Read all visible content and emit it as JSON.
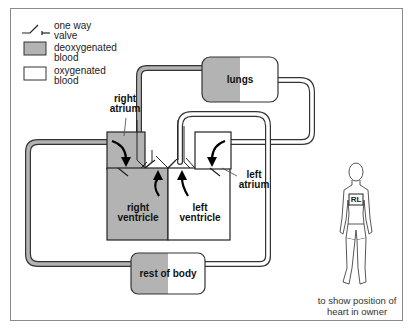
{
  "legend": {
    "items": [
      {
        "icon": "one-way-valve-icon",
        "label_line1": "one way",
        "label_line2": "valve"
      },
      {
        "icon": "deoxygenated-swatch",
        "label_line1": "deoxygenated",
        "label_line2": "blood",
        "color": "#b3b3b3"
      },
      {
        "icon": "oxygenated-swatch",
        "label_line1": "oxygenated",
        "label_line2": "blood",
        "color": "#ffffff"
      }
    ]
  },
  "organs": {
    "lungs": "lungs",
    "rest_of_body": "rest of body"
  },
  "chambers": {
    "right_atrium": {
      "line1": "right",
      "line2": "atrium"
    },
    "left_atrium": {
      "line1": "left",
      "line2": "atrium"
    },
    "right_ventricle": {
      "line1": "right",
      "line2": "ventricle"
    },
    "left_ventricle": {
      "line1": "left",
      "line2": "ventricle"
    }
  },
  "figure": {
    "heart_marker": "RL",
    "caption_line1": "to show position of",
    "caption_line2": "heart in owner"
  },
  "colors": {
    "deoxygenated": "#b3b3b3",
    "oxygenated": "#ffffff",
    "outline": "#222222"
  }
}
